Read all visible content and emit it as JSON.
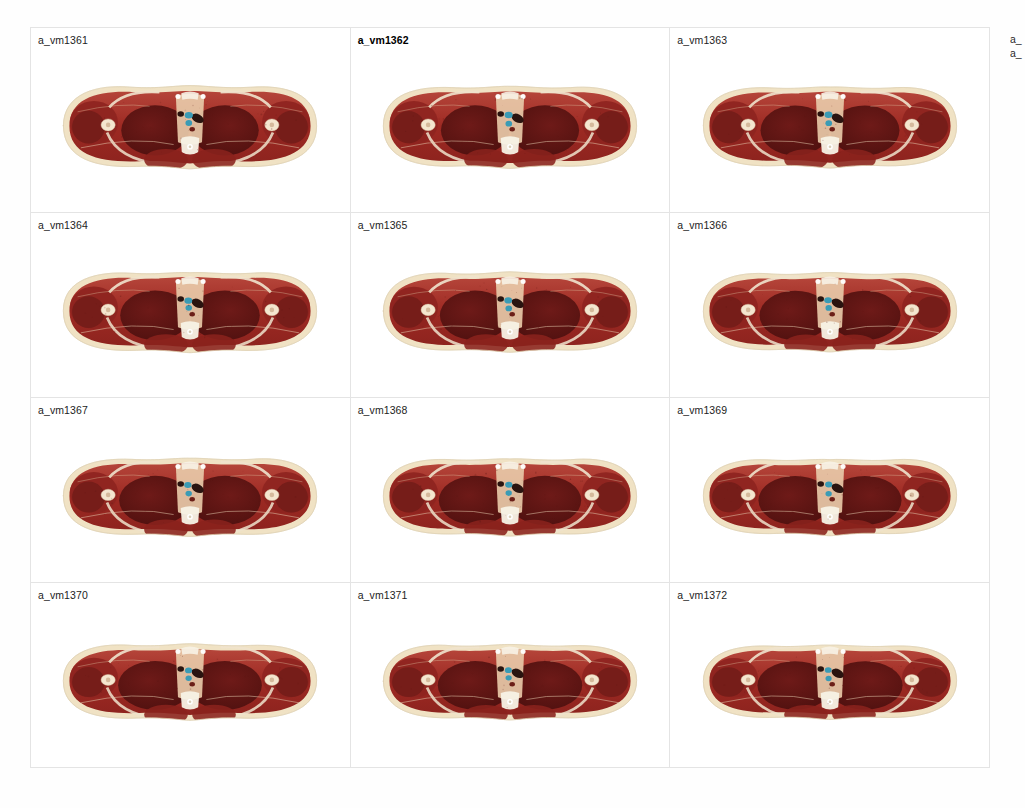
{
  "viewer": {
    "background_color": "#fefefe",
    "grid_line_color": "#e4e4e4",
    "columns": 3,
    "rows": 4
  },
  "slices": [
    {
      "label": "a_vm1361",
      "current": false
    },
    {
      "label": "a_vm1362",
      "current": true
    },
    {
      "label": "a_vm1363",
      "current": false
    },
    {
      "label": "a_vm1364",
      "current": false
    },
    {
      "label": "a_vm1365",
      "current": false
    },
    {
      "label": "a_vm1366",
      "current": false
    },
    {
      "label": "a_vm1367",
      "current": false
    },
    {
      "label": "a_vm1368",
      "current": false
    },
    {
      "label": "a_vm1369",
      "current": false
    },
    {
      "label": "a_vm1370",
      "current": false
    },
    {
      "label": "a_vm1371",
      "current": false
    },
    {
      "label": "a_vm1372",
      "current": false
    }
  ],
  "clipped_column": {
    "labels": [
      "a_",
      "a_"
    ]
  },
  "anatomy_colors": {
    "skin_fat": "#f0e2c4",
    "skin_edge": "#e8dcc0",
    "muscle": "#9e2a23",
    "muscle_light": "#b5453a",
    "lung": "#6e1a18",
    "lung_dark": "#5a1412",
    "bone": "#f4e6cf",
    "cartilage": "#efe3cd",
    "airway_teal": "#3a9bb5",
    "vessel_dark": "#2a1410",
    "spine_white": "#f7f2e6",
    "connective": "#e8c9a8"
  }
}
